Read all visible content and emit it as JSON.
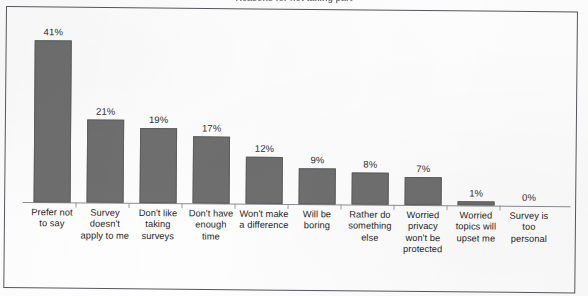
{
  "document": {
    "clipped_title": "Reasons for not taking part",
    "background_color": "#fefefe",
    "frame_color": "#55585e"
  },
  "chart_data": {
    "type": "bar",
    "title": "",
    "xlabel": "",
    "ylabel": "",
    "ylim": [
      0,
      45
    ],
    "grid": false,
    "legend": "none",
    "bar_color": "#6f6f6f",
    "categories": [
      "Prefer not to say",
      "Survey doesn't apply to me",
      "Don't like taking surveys",
      "Don't have enough time",
      "Won't make a difference",
      "Will be boring",
      "Rather do something else",
      "Worried privacy won't be protected",
      "Worried topics will upset me",
      "Survey is too personal"
    ],
    "category_lines": [
      [
        "Prefer not",
        "to say"
      ],
      [
        "Survey",
        "doesn't",
        "apply to me"
      ],
      [
        "Don't like",
        "taking",
        "surveys"
      ],
      [
        "Don't have",
        "enough",
        "time"
      ],
      [
        "Won't make",
        "a difference"
      ],
      [
        "Will be",
        "boring"
      ],
      [
        "Rather do",
        "something",
        "else"
      ],
      [
        "Worried",
        "privacy",
        "won't be",
        "protected"
      ],
      [
        "Worried",
        "topics will",
        "upset me"
      ],
      [
        "Survey is",
        "too",
        "personal"
      ]
    ],
    "values": [
      41,
      21,
      19,
      17,
      12,
      9,
      8,
      7,
      1,
      0
    ],
    "data_labels": [
      "41%",
      "21%",
      "19%",
      "17%",
      "12%",
      "9%",
      "8%",
      "7%",
      "1%",
      "0%"
    ]
  }
}
